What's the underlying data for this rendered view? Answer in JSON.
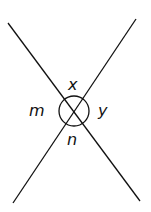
{
  "diagram": {
    "labels": {
      "top": "x",
      "right": "y",
      "bottom": "n",
      "left": "m"
    },
    "colors": {
      "line": "#111111",
      "background": "#ffffff"
    }
  }
}
